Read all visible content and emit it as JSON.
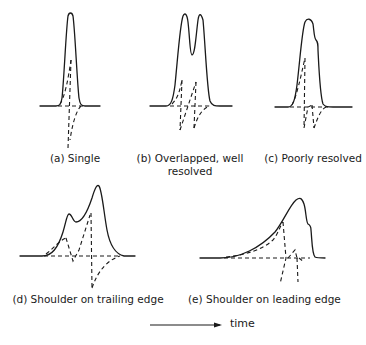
{
  "figure": {
    "panels": [
      {
        "id": "a",
        "caption": "(a) Single"
      },
      {
        "id": "b",
        "caption_line1": "(b) Overlapped, well",
        "caption_line2": "resolved"
      },
      {
        "id": "c",
        "caption": "(c) Poorly resolved"
      },
      {
        "id": "d",
        "caption": "(d) Shoulder on trailing edge"
      },
      {
        "id": "e",
        "caption": "(e) Shoulder on leading edge"
      }
    ],
    "axis": {
      "label": "time",
      "direction": "right-arrow"
    },
    "legend_semantics": {
      "solid": "detector signal (peak profile)",
      "dashed": "derivative / tangent construction lines"
    }
  }
}
